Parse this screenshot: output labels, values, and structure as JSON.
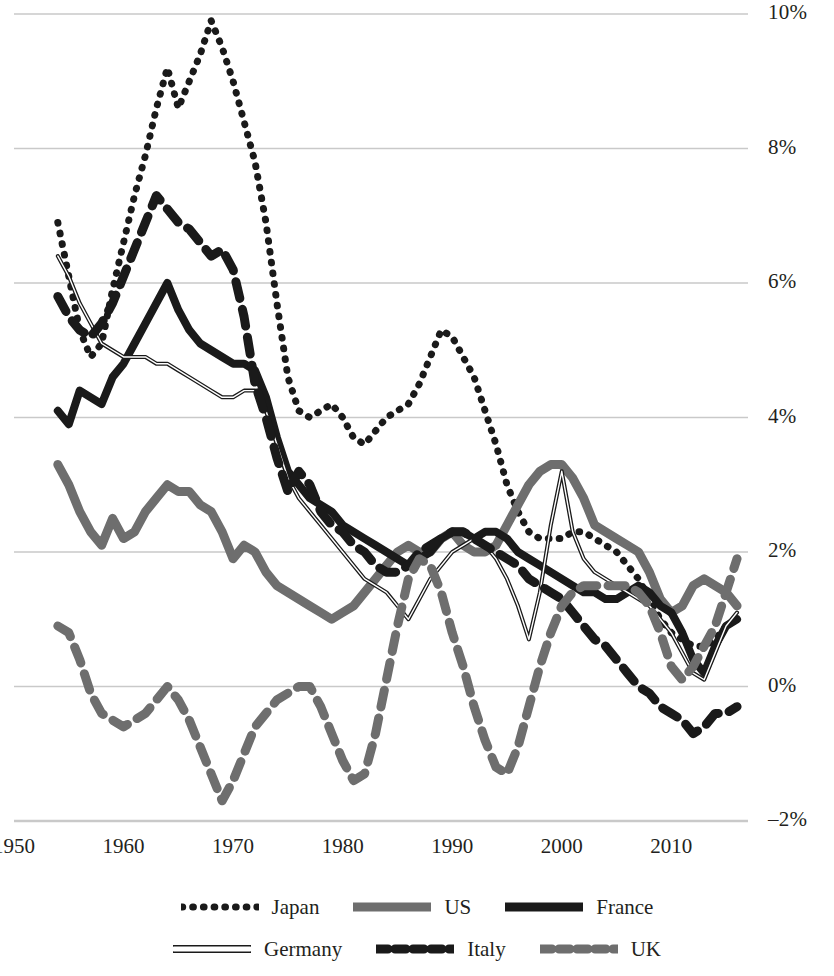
{
  "chart_data": {
    "type": "line",
    "title": "",
    "subtitle": "",
    "xlabel": "",
    "ylabel": "",
    "xlim": [
      1950,
      2017
    ],
    "ylim": [
      -2,
      10
    ],
    "grid": true,
    "y_unit": "percent",
    "legend_position": "bottom",
    "x_ticks": [
      1950,
      1960,
      1970,
      1980,
      1990,
      2000,
      2010
    ],
    "x_tick_labels": [
      "1950",
      "1960",
      "1970",
      "1980",
      "1990",
      "2000",
      "2010"
    ],
    "y_ticks": [
      -2,
      0,
      2,
      4,
      6,
      8,
      10
    ],
    "y_tick_labels": [
      "–2%",
      "0%",
      "2%",
      "4%",
      "6%",
      "8%",
      "10%"
    ],
    "x_start": 1954,
    "x_end": 2016,
    "series": [
      {
        "name": "Japan",
        "style": "dotted",
        "color": "#1a1a1a",
        "width": 7,
        "values": [
          6.9,
          6.1,
          5.3,
          4.9,
          5.1,
          5.9,
          6.6,
          7.3,
          7.9,
          8.6,
          9.2,
          8.6,
          9.0,
          9.4,
          9.9,
          9.5,
          9.0,
          8.4,
          7.8,
          6.9,
          5.7,
          4.6,
          4.1,
          4.0,
          4.1,
          4.2,
          4.0,
          3.7,
          3.6,
          3.8,
          4.0,
          4.1,
          4.2,
          4.5,
          4.9,
          5.3,
          5.2,
          4.9,
          4.6,
          4.1,
          3.6,
          3.0,
          2.6,
          2.3,
          2.2,
          2.2,
          2.2,
          2.3,
          2.3,
          2.2,
          2.1,
          2.0,
          1.8,
          1.6,
          1.3,
          1.0,
          0.8,
          0.7,
          0.6,
          0.6,
          0.7,
          0.9,
          1.0
        ]
      },
      {
        "name": "US",
        "style": "solid",
        "color": "#6e6e6e",
        "width": 9,
        "values": [
          3.3,
          3.0,
          2.6,
          2.3,
          2.1,
          2.5,
          2.2,
          2.3,
          2.6,
          2.8,
          3.0,
          2.9,
          2.9,
          2.7,
          2.6,
          2.3,
          1.9,
          2.1,
          2.0,
          1.7,
          1.5,
          1.4,
          1.3,
          1.2,
          1.1,
          1.0,
          1.1,
          1.2,
          1.4,
          1.6,
          1.8,
          2.0,
          2.1,
          2.0,
          2.0,
          2.2,
          2.3,
          2.1,
          2.0,
          2.0,
          2.1,
          2.4,
          2.7,
          3.0,
          3.2,
          3.3,
          3.3,
          3.1,
          2.8,
          2.4,
          2.3,
          2.2,
          2.1,
          2.0,
          1.7,
          1.3,
          1.1,
          1.2,
          1.5,
          1.6,
          1.5,
          1.4,
          1.2
        ]
      },
      {
        "name": "France",
        "style": "solid",
        "color": "#1a1a1a",
        "width": 8,
        "values": [
          4.1,
          3.9,
          4.4,
          4.3,
          4.2,
          4.6,
          4.8,
          5.1,
          5.4,
          5.7,
          6.0,
          5.6,
          5.3,
          5.1,
          5.0,
          4.9,
          4.8,
          4.8,
          4.7,
          4.3,
          3.7,
          3.2,
          3.0,
          2.8,
          2.7,
          2.6,
          2.4,
          2.3,
          2.2,
          2.1,
          2.0,
          1.9,
          1.8,
          1.9,
          2.0,
          2.2,
          2.3,
          2.3,
          2.2,
          2.3,
          2.3,
          2.2,
          2.0,
          1.9,
          1.8,
          1.7,
          1.6,
          1.5,
          1.4,
          1.4,
          1.3,
          1.3,
          1.4,
          1.5,
          1.4,
          1.2,
          1.1,
          0.8,
          0.4,
          0.2,
          0.6,
          0.9,
          1.0
        ]
      },
      {
        "name": "Germany",
        "style": "thin-outline",
        "color": "#1a1a1a",
        "width": 4,
        "values": [
          6.4,
          6.1,
          5.7,
          5.4,
          5.1,
          5.0,
          4.9,
          4.9,
          4.9,
          4.8,
          4.8,
          4.7,
          4.6,
          4.5,
          4.4,
          4.3,
          4.3,
          4.4,
          4.4,
          4.1,
          3.6,
          3.1,
          2.8,
          2.6,
          2.4,
          2.2,
          2.0,
          1.8,
          1.6,
          1.5,
          1.4,
          1.2,
          1.0,
          1.3,
          1.6,
          1.8,
          2.0,
          2.1,
          2.2,
          2.1,
          1.9,
          1.6,
          1.2,
          0.7,
          1.4,
          2.4,
          3.2,
          2.3,
          1.9,
          1.7,
          1.6,
          1.5,
          1.4,
          1.3,
          1.2,
          1.0,
          0.8,
          0.5,
          0.2,
          0.1,
          0.5,
          0.9,
          1.1
        ]
      },
      {
        "name": "Italy",
        "style": "dashed",
        "color": "#1a1a1a",
        "width": 9,
        "values": [
          5.8,
          5.5,
          5.3,
          5.2,
          5.4,
          5.7,
          6.1,
          6.5,
          6.9,
          7.3,
          7.1,
          6.9,
          6.8,
          6.6,
          6.4,
          6.5,
          6.2,
          5.5,
          4.5,
          4.0,
          3.4,
          2.9,
          3.2,
          3.0,
          2.6,
          2.4,
          2.3,
          2.1,
          2.0,
          1.8,
          1.7,
          1.7,
          1.8,
          2.0,
          2.1,
          2.2,
          2.3,
          2.3,
          2.2,
          2.1,
          2.0,
          1.9,
          1.8,
          1.6,
          1.5,
          1.4,
          1.3,
          1.1,
          0.9,
          0.7,
          0.6,
          0.4,
          0.2,
          0.0,
          -0.1,
          -0.3,
          -0.4,
          -0.5,
          -0.7,
          -0.6,
          -0.4,
          -0.4,
          -0.3
        ]
      },
      {
        "name": "UK",
        "style": "dashed",
        "color": "#6e6e6e",
        "width": 9,
        "values": [
          0.9,
          0.8,
          0.4,
          -0.1,
          -0.4,
          -0.5,
          -0.6,
          -0.5,
          -0.4,
          -0.2,
          0.0,
          -0.2,
          -0.5,
          -0.9,
          -1.3,
          -1.7,
          -1.4,
          -1.0,
          -0.6,
          -0.4,
          -0.2,
          -0.1,
          0.0,
          0.0,
          -0.3,
          -0.7,
          -1.1,
          -1.4,
          -1.3,
          -0.7,
          0.1,
          0.9,
          1.6,
          1.9,
          1.8,
          1.4,
          0.8,
          0.3,
          -0.3,
          -0.8,
          -1.2,
          -1.3,
          -0.9,
          -0.3,
          0.3,
          0.8,
          1.2,
          1.4,
          1.5,
          1.5,
          1.5,
          1.5,
          1.5,
          1.4,
          1.2,
          0.8,
          0.3,
          0.1,
          0.3,
          0.6,
          0.9,
          1.4,
          1.9
        ]
      }
    ]
  },
  "legend": {
    "rows": [
      [
        {
          "label": "Japan",
          "swatch": "dotted-black"
        },
        {
          "label": "US",
          "swatch": "solid-gray"
        },
        {
          "label": "France",
          "swatch": "solid-black"
        }
      ],
      [
        {
          "label": "Germany",
          "swatch": "thin-outline-black"
        },
        {
          "label": "Italy",
          "swatch": "dashed-black"
        },
        {
          "label": "UK",
          "swatch": "dashed-gray"
        }
      ]
    ]
  },
  "colors": {
    "black": "#1a1a1a",
    "gray": "#6e6e6e",
    "gridline": "#c9c9c9",
    "background": "#ffffff",
    "text": "#231f20"
  }
}
